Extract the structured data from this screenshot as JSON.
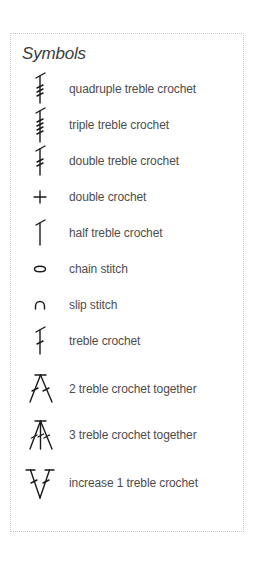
{
  "legend": {
    "title": "Symbols",
    "items": [
      {
        "icon": "quadruple-treble-crochet-symbol",
        "label": "quadruple treble crochet"
      },
      {
        "icon": "triple-treble-crochet-symbol",
        "label": "triple treble crochet"
      },
      {
        "icon": "double-treble-crochet-symbol",
        "label": "double treble crochet"
      },
      {
        "icon": "double-crochet-symbol",
        "label": "double crochet"
      },
      {
        "icon": "half-treble-crochet-symbol",
        "label": "half treble crochet"
      },
      {
        "icon": "chain-stitch-symbol",
        "label": "chain stitch"
      },
      {
        "icon": "slip-stitch-symbol",
        "label": "slip stitch"
      },
      {
        "icon": "treble-crochet-symbol",
        "label": "treble crochet"
      },
      {
        "icon": "two-treble-together-symbol",
        "label": "2 treble crochet together"
      },
      {
        "icon": "three-treble-together-symbol",
        "label": "3 treble crochet together"
      },
      {
        "icon": "increase-treble-symbol",
        "label": "increase 1 treble crochet"
      }
    ]
  },
  "colors": {
    "ink": "#1a1a1a",
    "text": "#4d4d4d",
    "border": "#c8c8c8"
  }
}
